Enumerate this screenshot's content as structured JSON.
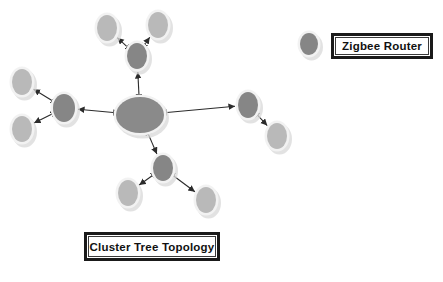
{
  "figure": {
    "background_color": "#ffffff",
    "title": "Cluster Tree Topology",
    "kind": "network-topology-diagram"
  },
  "legend": {
    "items": [
      {
        "icon_name": "zigbee-router-node-icon",
        "label": "Zigbee Router",
        "node_color": "#868686",
        "box": {
          "x": 331,
          "y": 33,
          "w": 102,
          "h": 26
        },
        "icon": {
          "cx": 309,
          "cy": 44,
          "rx": 9,
          "ry": 11
        }
      }
    ]
  },
  "caption": {
    "label": "Cluster Tree Topology",
    "box": {
      "x": 84,
      "y": 232,
      "w": 136,
      "h": 29
    }
  },
  "colors": {
    "coordinator": "#8a8a8a",
    "router": "#868686",
    "end_device": "#b9b9b9",
    "node_halo": "#f2f2f2",
    "node_shadow": "#d8d8d8",
    "link": "#2b2b2b",
    "box_border": "#1a1a1a",
    "text": "#111111",
    "background": "#ffffff"
  },
  "chart_data": {
    "type": "graph",
    "title": "Cluster Tree Topology",
    "nodes": [
      {
        "id": "coordinator",
        "name": "zigbee-coordinator",
        "role": "coordinator",
        "cx": 140,
        "cy": 115,
        "rx": 24,
        "ry": 18,
        "color": "#8a8a8a"
      },
      {
        "id": "r-top",
        "name": "zigbee-router-top",
        "role": "router",
        "cx": 137,
        "cy": 56,
        "rx": 10,
        "ry": 13,
        "color": "#868686"
      },
      {
        "id": "e-top-left",
        "name": "end-device-top-left",
        "role": "end-device",
        "cx": 107,
        "cy": 28,
        "rx": 10,
        "ry": 13,
        "color": "#b9b9b9"
      },
      {
        "id": "e-top-right",
        "name": "end-device-top-right",
        "role": "end-device",
        "cx": 158,
        "cy": 25,
        "rx": 10,
        "ry": 13,
        "color": "#b9b9b9"
      },
      {
        "id": "r-left",
        "name": "zigbee-router-left",
        "role": "router",
        "cx": 64,
        "cy": 108,
        "rx": 11,
        "ry": 14,
        "color": "#868686"
      },
      {
        "id": "e-left-top",
        "name": "end-device-left-top",
        "role": "end-device",
        "cx": 22,
        "cy": 82,
        "rx": 10,
        "ry": 13,
        "color": "#b9b9b9"
      },
      {
        "id": "e-left-bottom",
        "name": "end-device-left-bottom",
        "role": "end-device",
        "cx": 22,
        "cy": 129,
        "rx": 10,
        "ry": 13,
        "color": "#b9b9b9"
      },
      {
        "id": "r-right",
        "name": "zigbee-router-right",
        "role": "router",
        "cx": 248,
        "cy": 105,
        "rx": 10,
        "ry": 13,
        "color": "#868686"
      },
      {
        "id": "e-right",
        "name": "end-device-right",
        "role": "end-device",
        "cx": 277,
        "cy": 136,
        "rx": 10,
        "ry": 13,
        "color": "#b9b9b9"
      },
      {
        "id": "r-bottom",
        "name": "zigbee-router-bottom",
        "role": "router",
        "cx": 163,
        "cy": 168,
        "rx": 10,
        "ry": 13,
        "color": "#868686"
      },
      {
        "id": "e-bottom-left",
        "name": "end-device-bottom-left",
        "role": "end-device",
        "cx": 128,
        "cy": 193,
        "rx": 10,
        "ry": 13,
        "color": "#b9b9b9"
      },
      {
        "id": "e-bottom-right",
        "name": "end-device-bottom-right",
        "role": "end-device",
        "cx": 206,
        "cy": 200,
        "rx": 10,
        "ry": 13,
        "color": "#b9b9b9"
      }
    ],
    "edges": [
      {
        "name": "link-coordinator-router-top",
        "from": "coordinator",
        "to": "r-top",
        "arrows": "both"
      },
      {
        "name": "link-coordinator-router-left",
        "from": "coordinator",
        "to": "r-left",
        "arrows": "both"
      },
      {
        "name": "link-coordinator-router-right",
        "from": "coordinator",
        "to": "r-right",
        "arrows": "both"
      },
      {
        "name": "link-coordinator-router-bottom",
        "from": "coordinator",
        "to": "r-bottom",
        "arrows": "both"
      },
      {
        "name": "link-router-top-end-left",
        "from": "r-top",
        "to": "e-top-left",
        "arrows": "both"
      },
      {
        "name": "link-router-top-end-right",
        "from": "r-top",
        "to": "e-top-right",
        "arrows": "both"
      },
      {
        "name": "link-router-left-end-top",
        "from": "r-left",
        "to": "e-left-top",
        "arrows": "both"
      },
      {
        "name": "link-router-left-end-bottom",
        "from": "r-left",
        "to": "e-left-bottom",
        "arrows": "both"
      },
      {
        "name": "link-router-right-end",
        "from": "r-right",
        "to": "e-right",
        "arrows": "both"
      },
      {
        "name": "link-router-bottom-end-left",
        "from": "r-bottom",
        "to": "e-bottom-left",
        "arrows": "both"
      },
      {
        "name": "link-router-bottom-end-right",
        "from": "r-bottom",
        "to": "e-bottom-right",
        "arrows": "both"
      }
    ],
    "legend_entries": [
      "Zigbee Router"
    ],
    "xlim": [
      0,
      443
    ],
    "ylim": [
      0,
      282
    ],
    "grid": false,
    "legend_position": "top-right"
  }
}
